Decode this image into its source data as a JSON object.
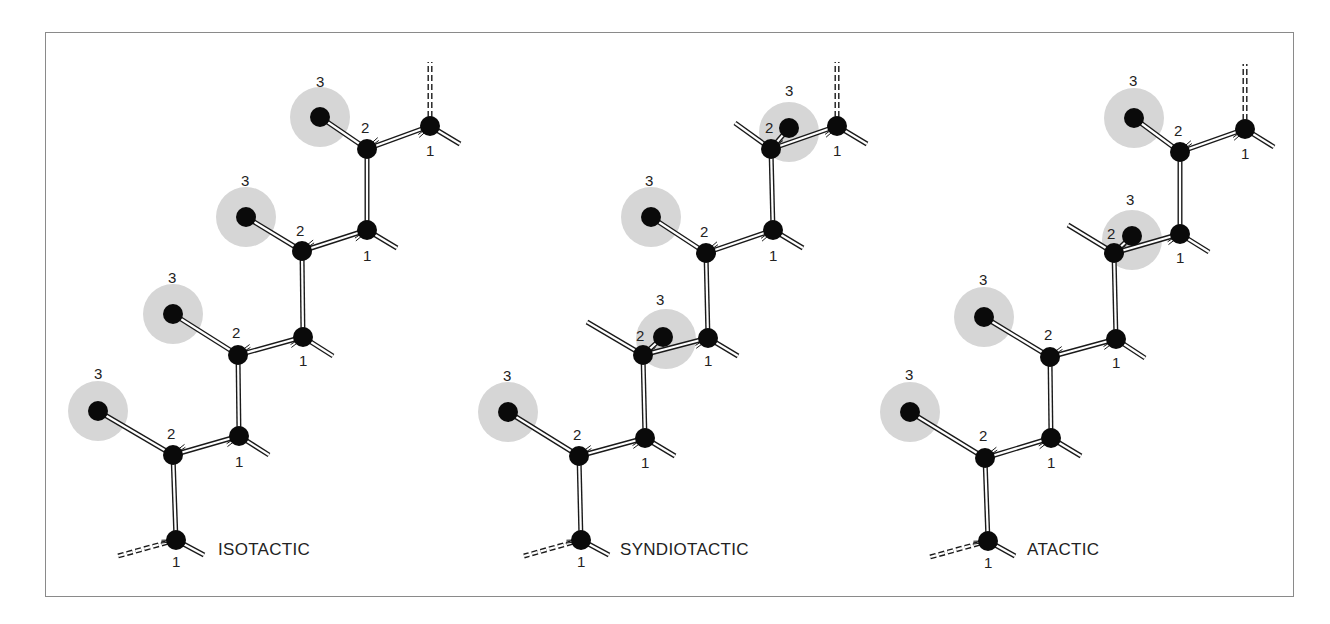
{
  "figure": {
    "frame": {
      "x": 45,
      "y": 32,
      "w": 1249,
      "h": 565
    },
    "colors": {
      "atom": "#0a0a0a",
      "halo": "#d6d6d6",
      "bond_edge": "#1a1a1a",
      "bond_fill": "#ffffff",
      "frame": "#8a8a8a",
      "text": "#222222"
    },
    "panels": [
      {
        "id": "isotactic",
        "title": "ISOTACTIC",
        "title_pos": [
          218,
          555
        ],
        "top_dash": [
          [
            430,
            126
          ],
          [
            430,
            62
          ]
        ],
        "bottom": {
          "node": [
            176,
            540
          ],
          "label": "1",
          "label_pos": [
            172,
            567
          ],
          "dash_end": [
            118,
            556
          ],
          "stub_end": [
            204,
            555
          ],
          "arrow_from": [
            150,
            533
          ]
        },
        "units": [
          {
            "n1": [
              430,
              126
            ],
            "n2": [
              367,
              149
            ],
            "n3": [
              320,
              117
            ],
            "halo": [
              320,
              117
            ],
            "flipped": false,
            "l1": "1",
            "l2": "2",
            "l3": "3",
            "l1_pos": [
              426,
              156
            ],
            "l2_pos": [
              361,
              133
            ],
            "l3_pos": [
              316,
              87
            ],
            "n1_stub": [
              460,
              144
            ]
          },
          {
            "n1": [
              367,
              230
            ],
            "n2": [
              302,
              251
            ],
            "n3": [
              246,
              217
            ],
            "halo": [
              246,
              217
            ],
            "flipped": false,
            "l1": "1",
            "l2": "2",
            "l3": "3",
            "l1_pos": [
              363,
              261
            ],
            "l2_pos": [
              296,
              236
            ],
            "l3_pos": [
              241,
              186
            ],
            "n1_stub": [
              397,
              248
            ]
          },
          {
            "n1": [
              303,
              337
            ],
            "n2": [
              238,
              355
            ],
            "n3": [
              173,
              314
            ],
            "halo": [
              173,
              314
            ],
            "flipped": false,
            "l1": "1",
            "l2": "2",
            "l3": "3",
            "l1_pos": [
              299,
              366
            ],
            "l2_pos": [
              232,
              338
            ],
            "l3_pos": [
              168,
              283
            ],
            "n1_stub": [
              333,
              356
            ]
          },
          {
            "n1": [
              239,
              436
            ],
            "n2": [
              173,
              455
            ],
            "n3": [
              98,
              411
            ],
            "halo": [
              98,
              411
            ],
            "flipped": false,
            "l1": "1",
            "l2": "2",
            "l3": "3",
            "l1_pos": [
              235,
              467
            ],
            "l2_pos": [
              167,
              439
            ],
            "l3_pos": [
              94,
              379
            ],
            "n1_stub": [
              269,
              455
            ]
          }
        ]
      },
      {
        "id": "syndiotactic",
        "title": "SYNDIOTACTIC",
        "title_pos": [
          620,
          555
        ],
        "top_dash": [
          [
            837,
            126
          ],
          [
            837,
            62
          ]
        ],
        "bottom": {
          "node": [
            581,
            540
          ],
          "label": "1",
          "label_pos": [
            577,
            567
          ],
          "dash_end": [
            524,
            556
          ],
          "stub_end": [
            609,
            555
          ],
          "arrow_from": [
            555,
            533
          ]
        },
        "units": [
          {
            "n1": [
              837,
              126
            ],
            "n2": [
              771,
              149
            ],
            "n3": [
              789,
              128
            ],
            "halo": [
              789,
              132
            ],
            "flipped": true,
            "stub": [
              735,
              123
            ],
            "l1": "1",
            "l2": "2",
            "l3": "3",
            "l1_pos": [
              833,
              156
            ],
            "l2_pos": [
              765,
              133
            ],
            "l3_pos": [
              785,
              96
            ],
            "n1_stub": [
              867,
              144
            ]
          },
          {
            "n1": [
              773,
              230
            ],
            "n2": [
              706,
              253
            ],
            "n3": [
              651,
              217
            ],
            "halo": [
              651,
              217
            ],
            "flipped": false,
            "l1": "1",
            "l2": "2",
            "l3": "3",
            "l1_pos": [
              769,
              261
            ],
            "l2_pos": [
              700,
              237
            ],
            "l3_pos": [
              645,
              186
            ],
            "n1_stub": [
              803,
              248
            ]
          },
          {
            "n1": [
              708,
              338
            ],
            "n2": [
              643,
              355
            ],
            "n3": [
              663,
              337
            ],
            "halo": [
              666,
              339
            ],
            "flipped": true,
            "stub": [
              587,
              322
            ],
            "l1": "1",
            "l2": "2",
            "l3": "3",
            "l1_pos": [
              704,
              366
            ],
            "l2_pos": [
              636,
              341
            ],
            "l3_pos": [
              656,
              305
            ],
            "n1_stub": [
              738,
              356
            ]
          },
          {
            "n1": [
              645,
              438
            ],
            "n2": [
              579,
              456
            ],
            "n3": [
              508,
              412
            ],
            "halo": [
              508,
              412
            ],
            "flipped": false,
            "l1": "1",
            "l2": "2",
            "l3": "3",
            "l1_pos": [
              641,
              468
            ],
            "l2_pos": [
              573,
              440
            ],
            "l3_pos": [
              503,
              381
            ],
            "n1_stub": [
              675,
              456
            ]
          }
        ]
      },
      {
        "id": "atactic",
        "title": "ATACTIC",
        "title_pos": [
          1027,
          555
        ],
        "top_dash": [
          [
            1245,
            129
          ],
          [
            1245,
            64
          ]
        ],
        "bottom": {
          "node": [
            988,
            541
          ],
          "label": "1",
          "label_pos": [
            984,
            568
          ],
          "dash_end": [
            930,
            557
          ],
          "stub_end": [
            1015,
            556
          ],
          "arrow_from": [
            962,
            534
          ]
        },
        "units": [
          {
            "n1": [
              1245,
              129
            ],
            "n2": [
              1180,
              152
            ],
            "n3": [
              1134,
              118
            ],
            "halo": [
              1134,
              118
            ],
            "flipped": false,
            "l1": "1",
            "l2": "2",
            "l3": "3",
            "l1_pos": [
              1241,
              159
            ],
            "l2_pos": [
              1174,
              136
            ],
            "l3_pos": [
              1129,
              86
            ],
            "n1_stub": [
              1274,
              147
            ]
          },
          {
            "n1": [
              1180,
              234
            ],
            "n2": [
              1114,
              253
            ],
            "n3": [
              1132,
              236
            ],
            "halo": [
              1132,
              240
            ],
            "flipped": true,
            "stub": [
              1068,
              225
            ],
            "l1": "1",
            "l2": "2",
            "l3": "3",
            "l1_pos": [
              1176,
              263
            ],
            "l2_pos": [
              1107,
              239
            ],
            "l3_pos": [
              1126,
              205
            ],
            "n1_stub": [
              1209,
              252
            ]
          },
          {
            "n1": [
              1116,
              339
            ],
            "n2": [
              1050,
              357
            ],
            "n3": [
              984,
              317
            ],
            "halo": [
              984,
              317
            ],
            "flipped": false,
            "l1": "1",
            "l2": "2",
            "l3": "3",
            "l1_pos": [
              1112,
              368
            ],
            "l2_pos": [
              1044,
              340
            ],
            "l3_pos": [
              979,
              285
            ],
            "n1_stub": [
              1145,
              358
            ]
          },
          {
            "n1": [
              1051,
              438
            ],
            "n2": [
              985,
              458
            ],
            "n3": [
              910,
              412
            ],
            "halo": [
              910,
              412
            ],
            "flipped": false,
            "l1": "1",
            "l2": "2",
            "l3": "3",
            "l1_pos": [
              1047,
              468
            ],
            "l2_pos": [
              979,
              441
            ],
            "l3_pos": [
              905,
              380
            ],
            "n1_stub": [
              1081,
              456
            ]
          }
        ]
      }
    ],
    "sizes": {
      "atom_r": 10,
      "halo_r": 30
    }
  }
}
